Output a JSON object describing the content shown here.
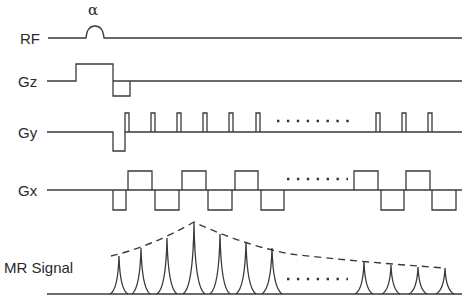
{
  "diagram": {
    "type": "MRI pulse sequence timing diagram (EPI-style)",
    "rows": [
      {
        "id": "rf",
        "label": "RF",
        "annotation": "α"
      },
      {
        "id": "gz",
        "label": "Gz"
      },
      {
        "id": "gy",
        "label": "Gy"
      },
      {
        "id": "gx",
        "label": "Gx"
      },
      {
        "id": "signal",
        "label": "MR Signal"
      }
    ],
    "ellipsis": "........",
    "colors": {
      "stroke": "#3a3a3a",
      "background": "#ffffff",
      "text": "#2a2a2a"
    }
  }
}
